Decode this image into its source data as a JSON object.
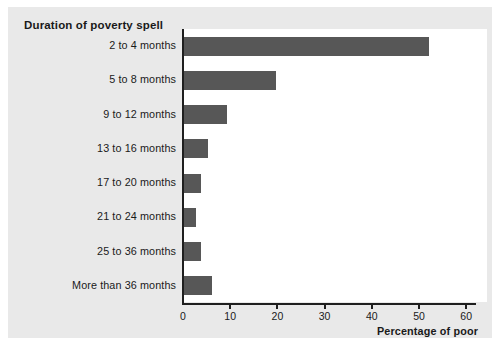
{
  "chart_data": {
    "type": "bar",
    "orientation": "horizontal",
    "title": "Duration of poverty spell",
    "xlabel": "Percentage of poor",
    "ylabel": "Duration of poverty spell",
    "categories": [
      "2 to 4 months",
      "5 to 8 months",
      "9 to 12 months",
      "13 to 16 months",
      "17 to 20 months",
      "21 to 24 months",
      "25 to 36 months",
      "More than 36 months"
    ],
    "values": [
      52,
      19.5,
      9.2,
      5,
      3.5,
      2.5,
      3.5,
      6
    ],
    "xlim": [
      0,
      62
    ],
    "xticks": [
      0,
      10,
      20,
      30,
      40,
      50,
      60
    ],
    "xtick_labels": [
      "0",
      "10",
      "20",
      "30",
      "40",
      "50",
      "60"
    ],
    "grid": false,
    "legend": false,
    "bar_color": "#575757",
    "plot_background": "#ffffff",
    "panel_background": "#e9e9e9",
    "axis_color": "#1f1f1f"
  }
}
